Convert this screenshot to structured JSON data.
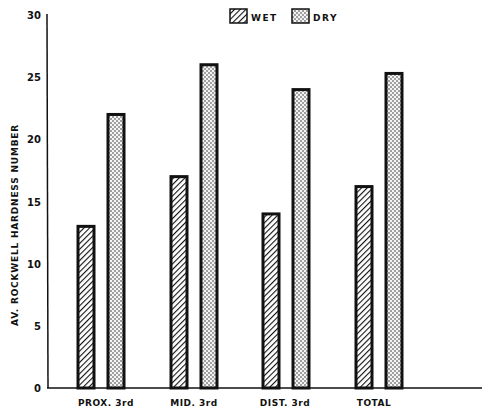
{
  "chart_data": {
    "type": "bar",
    "title": "",
    "xlabel": "",
    "ylabel": "AV. ROCKWELL HARDNESS NUMBER",
    "ylim": [
      0,
      30
    ],
    "yticks": [
      0,
      5,
      10,
      15,
      20,
      25,
      30
    ],
    "grid": false,
    "legend_position": "top-center",
    "categories": [
      "PROX. 3rd",
      "MID. 3rd",
      "DIST. 3rd",
      "TOTAL"
    ],
    "series": [
      {
        "name": "WET",
        "pattern": "diagonal-hatch",
        "values": [
          13,
          17,
          14,
          16.2
        ]
      },
      {
        "name": "DRY",
        "pattern": "stipple-dots",
        "values": [
          22,
          26,
          24,
          25.3
        ]
      }
    ]
  },
  "colors": {
    "ink": "#111111",
    "background": "#ffffff"
  }
}
